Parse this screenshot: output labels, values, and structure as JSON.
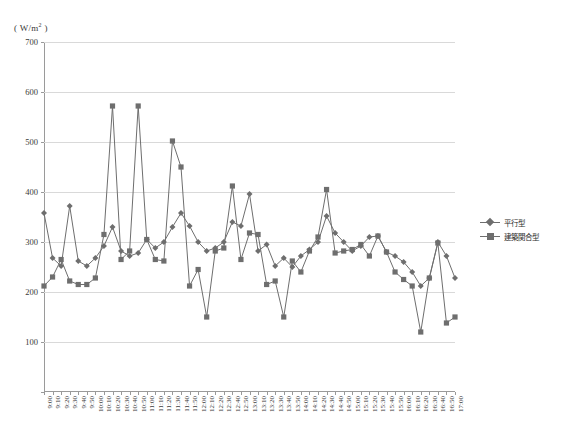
{
  "chart_data": {
    "type": "line",
    "title": "",
    "xlabel": "",
    "ylabel": "( W/m2 )",
    "ylim": [
      0,
      700
    ],
    "ytick_values": [
      0,
      100,
      200,
      300,
      400,
      500,
      600,
      700
    ],
    "ytick_labels": [
      "",
      "100",
      "200",
      "300",
      "400",
      "500",
      "600",
      "700"
    ],
    "grid": true,
    "legend_position": "right",
    "categories": [
      "9:00",
      "9:10",
      "9:20",
      "9:30",
      "9:40",
      "9:50",
      "10:00",
      "10:10",
      "10:20",
      "10:30",
      "10:40",
      "10:50",
      "11:00",
      "11:10",
      "11:20",
      "11:30",
      "11:40",
      "11:50",
      "12:00",
      "12:10",
      "12:20",
      "12:30",
      "12:40",
      "12:50",
      "13:00",
      "13:10",
      "13:20",
      "13:30",
      "13:40",
      "13:50",
      "14:00",
      "14:10",
      "14:20",
      "14:30",
      "14:40",
      "14:50",
      "15:00",
      "15:10",
      "15:20",
      "15:30",
      "15:40",
      "15:50",
      "16:00",
      "16:10",
      "16:20",
      "16:30",
      "16:40",
      "16:50",
      "17:00"
    ],
    "series": [
      {
        "name": "平行型",
        "marker": "diamond",
        "color": "#6e6e6e",
        "values": [
          358,
          268,
          252,
          372,
          262,
          252,
          268,
          292,
          330,
          282,
          272,
          278,
          305,
          288,
          300,
          330,
          358,
          332,
          300,
          282,
          288,
          300,
          340,
          332,
          396,
          282,
          295,
          252,
          268,
          250,
          272,
          285,
          300,
          352,
          318,
          300,
          282,
          292,
          310,
          312,
          280,
          272,
          260,
          240,
          212,
          228,
          300,
          272,
          228
        ]
      },
      {
        "name": "建築関合型",
        "marker": "square",
        "color": "#6e6e6e",
        "values": [
          212,
          230,
          265,
          222,
          215,
          215,
          228,
          315,
          572,
          265,
          282,
          572,
          305,
          265,
          262,
          502,
          450,
          212,
          245,
          150,
          282,
          288,
          412,
          265,
          318,
          315,
          215,
          222,
          150,
          262,
          240,
          282,
          310,
          405,
          278,
          282,
          285,
          295,
          272,
          312,
          280,
          240,
          225,
          212,
          120,
          228,
          298,
          138,
          150
        ]
      }
    ]
  },
  "legend": {
    "items": [
      {
        "label": "平行型"
      },
      {
        "label": "建築関合型"
      }
    ]
  },
  "colors": {
    "series1": "#6e6e6e",
    "series2": "#6e6e6e",
    "grid": "#d9d9d9",
    "axis": "#9a9a9a",
    "text": "#2b2b2b"
  }
}
